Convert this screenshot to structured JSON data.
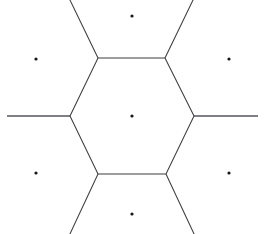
{
  "figure": {
    "background_color": "#ffffff",
    "line_color": "#3c3c42",
    "point_color": "#17171b",
    "canvas": {
      "width": 265,
      "height": 234
    }
  },
  "chart_data": {
    "type": "scatter",
    "xlabel": "",
    "ylabel": "",
    "xlim": [
      0,
      265
    ],
    "ylim": [
      0,
      234
    ],
    "grid": false,
    "legend": false,
    "seed_points": [
      {
        "label": "center",
        "x": 132,
        "y": 116
      },
      {
        "label": "top",
        "x": 132,
        "y": 16
      },
      {
        "label": "bottom",
        "x": 132,
        "y": 214
      },
      {
        "label": "upper-left",
        "x": 36,
        "y": 59
      },
      {
        "label": "upper-right",
        "x": 229,
        "y": 59
      },
      {
        "label": "lower-left",
        "x": 36,
        "y": 173
      },
      {
        "label": "lower-right",
        "x": 229,
        "y": 173
      }
    ],
    "hexagon_vertices": [
      {
        "label": "top-left",
        "x": 98,
        "y": 58
      },
      {
        "label": "top-right",
        "x": 165,
        "y": 58
      },
      {
        "label": "right",
        "x": 194,
        "y": 116
      },
      {
        "label": "bottom-right",
        "x": 166,
        "y": 174
      },
      {
        "label": "bottom-left",
        "x": 98,
        "y": 174
      },
      {
        "label": "left",
        "x": 70,
        "y": 116
      }
    ],
    "rays": [
      {
        "label": "ray-top-left",
        "from": {
          "x": 98,
          "y": 58
        },
        "to": {
          "x": 69,
          "y": -2
        }
      },
      {
        "label": "ray-top-right",
        "from": {
          "x": 165,
          "y": 58
        },
        "to": {
          "x": 194,
          "y": -2
        }
      },
      {
        "label": "ray-right",
        "from": {
          "x": 194,
          "y": 116
        },
        "to": {
          "x": 258,
          "y": 116
        }
      },
      {
        "label": "ray-bottom-right",
        "from": {
          "x": 166,
          "y": 174
        },
        "to": {
          "x": 195,
          "y": 236
        }
      },
      {
        "label": "ray-bottom-left",
        "from": {
          "x": 98,
          "y": 174
        },
        "to": {
          "x": 69,
          "y": 236
        }
      },
      {
        "label": "ray-left",
        "from": {
          "x": 70,
          "y": 116
        },
        "to": {
          "x": 7,
          "y": 116
        }
      }
    ],
    "point_radius": 1.6,
    "line_width": 1.05
  }
}
